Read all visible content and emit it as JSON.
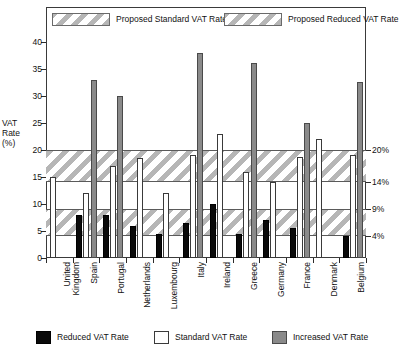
{
  "chart_data": {
    "type": "bar",
    "title": "",
    "xlabel": "",
    "ylabel": "VAT Rate (%)",
    "ylim": [
      0,
      42
    ],
    "yticks": [
      0,
      5,
      10,
      15,
      20,
      25,
      30,
      35,
      40
    ],
    "right_axis_ticks": [
      "20%",
      "14%",
      "9%",
      "4%"
    ],
    "right_axis_values": [
      20,
      14,
      9,
      4
    ],
    "grid": false,
    "legend_position": "top and bottom",
    "categories": [
      "United Kingdom",
      "Spain",
      "Portugal",
      "Netherlands",
      "Luxembourg",
      "Italy",
      "Ireland",
      "Greece",
      "Germany",
      "France",
      "Denmark",
      "Belgium"
    ],
    "series": [
      {
        "name": "Reduced VAT Rate",
        "color": "#0a0a0a",
        "values": [
          null,
          8,
          8,
          6,
          4.5,
          6.5,
          10,
          4.5,
          7,
          5.5,
          null,
          4
        ]
      },
      {
        "name": "Standard VAT Rate",
        "color": "#ffffff",
        "values": [
          15,
          12,
          17,
          18.5,
          12,
          19,
          23,
          16,
          14,
          18.6,
          22,
          19
        ]
      },
      {
        "name": "Increased VAT Rate",
        "color": "#8a8a8a",
        "values": [
          null,
          33,
          30,
          null,
          null,
          38,
          null,
          36,
          null,
          25,
          null,
          32.5
        ]
      }
    ],
    "bands": [
      {
        "name": "Proposed Standard VAT Rate",
        "from": 14,
        "to": 20
      },
      {
        "name": "Proposed Reduced VAT Rate",
        "from": 4,
        "to": 9
      }
    ]
  },
  "top_legend": [
    {
      "label": "Proposed Standard VAT Rate",
      "swatch": "hatched-band-swatch"
    },
    {
      "label": "Proposed Reduced VAT Rate",
      "swatch": "hatched-band-swatch"
    }
  ],
  "bottom_legend": [
    {
      "label": "Reduced VAT Rate",
      "swatch": "black-square-swatch"
    },
    {
      "label": "Standard VAT Rate",
      "swatch": "white-square-swatch"
    },
    {
      "label": "Increased VAT Rate",
      "swatch": "gray-square-swatch"
    }
  ],
  "axis": {
    "y_title_lines": [
      "VAT",
      "Rate",
      "(%)"
    ]
  },
  "caption": ""
}
